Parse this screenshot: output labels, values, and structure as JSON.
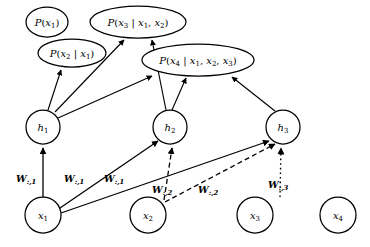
{
  "figure": {
    "type": "neural-autoregressive-network-diagram",
    "title": "",
    "colors": {
      "stroke": "#000000",
      "fill": "#ffffff",
      "background": "#ffffff"
    }
  },
  "output_nodes": [
    {
      "id": "p1",
      "label": "P(x1)",
      "text_main": "P(x",
      "sub1": "1",
      "tail": ")",
      "cx": 47,
      "cy": 22,
      "rx": 21,
      "ry": 15
    },
    {
      "id": "p2",
      "label": "P(x2 | x1)",
      "text_main": "P(x",
      "sub1": "2",
      "tail": ")",
      "cx": 72,
      "cy": 53,
      "rx": 33,
      "ry": 14
    },
    {
      "id": "p3",
      "label": "P(x3 | x1, x2)",
      "text_main": "P(x",
      "sub1": "3",
      "tail": ")",
      "cx": 138,
      "cy": 22,
      "rx": 47,
      "ry": 16
    },
    {
      "id": "p4",
      "label": "P(x4 | x1, x2, x3)",
      "text_main": "P(x",
      "sub1": "4",
      "tail": ")",
      "cx": 198,
      "cy": 60,
      "rx": 55,
      "ry": 16
    }
  ],
  "hidden_nodes": [
    {
      "id": "h1",
      "base": "h",
      "sub": "1",
      "cx": 43,
      "cy": 127,
      "r": 17
    },
    {
      "id": "h2",
      "base": "h",
      "sub": "2",
      "cx": 170,
      "cy": 127,
      "r": 17
    },
    {
      "id": "h3",
      "base": "h",
      "sub": "3",
      "cx": 283,
      "cy": 127,
      "r": 17
    }
  ],
  "input_nodes": [
    {
      "id": "x1",
      "base": "x",
      "sub": "1",
      "cx": 43,
      "cy": 215,
      "r": 18
    },
    {
      "id": "x2",
      "base": "x",
      "sub": "2",
      "cx": 148,
      "cy": 215,
      "r": 18
    },
    {
      "id": "x3",
      "base": "x",
      "sub": "3",
      "cx": 255,
      "cy": 215,
      "r": 18
    },
    {
      "id": "x4",
      "base": "x",
      "sub": "4",
      "cx": 338,
      "cy": 215,
      "r": 18
    }
  ],
  "weight_labels": [
    {
      "id": "w1a",
      "base": "W",
      "sub": ":,1",
      "x": 16,
      "y": 178,
      "style": "solid"
    },
    {
      "id": "w1b",
      "base": "W",
      "sub": ":,1",
      "x": 64,
      "y": 178,
      "style": "solid"
    },
    {
      "id": "w1c",
      "base": "W",
      "sub": ":,1",
      "x": 104,
      "y": 178,
      "style": "solid"
    },
    {
      "id": "w2a",
      "base": "W",
      "sub": ":,2",
      "x": 152,
      "y": 190,
      "style": "dashed"
    },
    {
      "id": "w2b",
      "base": "W",
      "sub": ":,2",
      "x": 198,
      "y": 190,
      "style": "dashed"
    },
    {
      "id": "w3a",
      "base": "W",
      "sub": ":,3",
      "x": 268,
      "y": 185,
      "style": "dotted"
    }
  ],
  "edges_hidden_to_output": [
    {
      "from": "h1",
      "to": "p2"
    },
    {
      "from": "h1",
      "to": "p3"
    },
    {
      "from": "h1",
      "to": "p4"
    },
    {
      "from": "h2",
      "to": "p3"
    },
    {
      "from": "h2",
      "to": "p4"
    },
    {
      "from": "h3",
      "to": "p4"
    }
  ],
  "edges_input_to_hidden": [
    {
      "from": "x1",
      "to": "h1",
      "style": "solid",
      "weight": "W:,1"
    },
    {
      "from": "x1",
      "to": "h2",
      "style": "solid",
      "weight": "W:,1"
    },
    {
      "from": "x1",
      "to": "h3",
      "style": "solid",
      "weight": "W:,1"
    },
    {
      "from": "x2",
      "to": "h2",
      "style": "dashed",
      "weight": "W:,2"
    },
    {
      "from": "x2",
      "to": "h3",
      "style": "dashed",
      "weight": "W:,2"
    },
    {
      "from": "x3",
      "to": "h3",
      "style": "dotted",
      "weight": "W:,3"
    }
  ],
  "conditional_text": {
    "p1": {
      "pre": "P(",
      "v": "x",
      "vsub": "1",
      "post": ")"
    },
    "p2": {
      "pre": "P(",
      "v": "x",
      "vsub": "2",
      "bar": "|",
      "c1": "x",
      "c1sub": "1",
      "post": ")"
    },
    "p3": {
      "pre": "P(",
      "v": "x",
      "vsub": "3",
      "bar": "|",
      "c1": "x",
      "c1sub": "1",
      "c2": "x",
      "c2sub": "2",
      "post": ")"
    },
    "p4": {
      "pre": "P(",
      "v": "x",
      "vsub": "4",
      "bar": "|",
      "c1": "x",
      "c1sub": "1",
      "c2": "x",
      "c2sub": "2",
      "c3": "x",
      "c3sub": "3",
      "post": ")"
    }
  }
}
